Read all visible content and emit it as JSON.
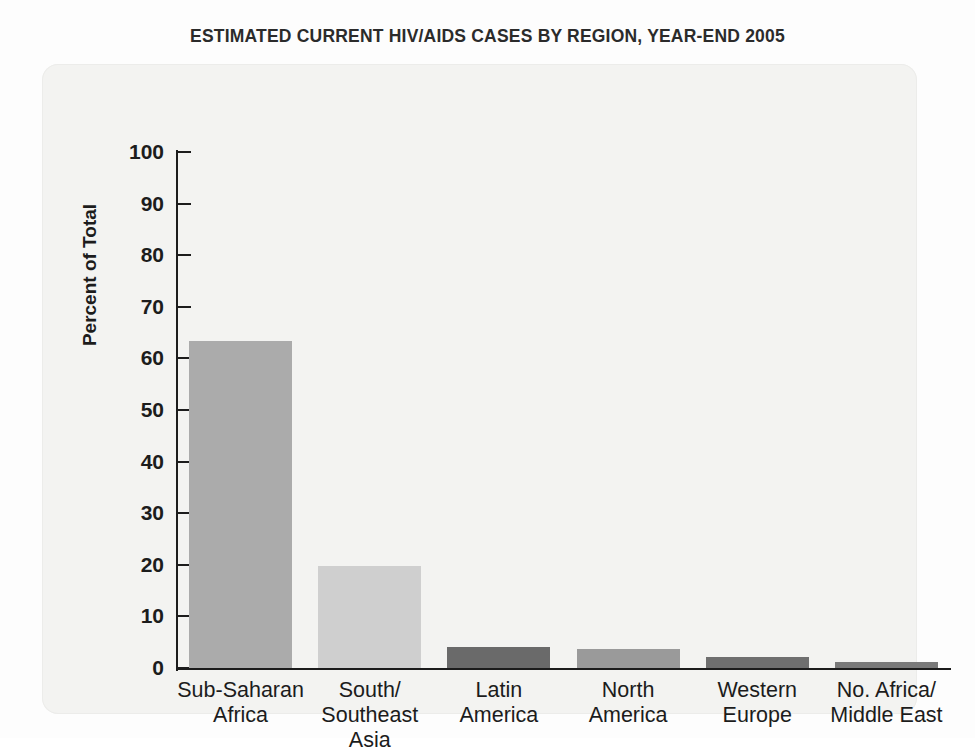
{
  "title": "ESTIMATED CURRENT HIV/AIDS CASES BY REGION, YEAR-END 2005",
  "chart_data": {
    "type": "bar",
    "title": "ESTIMATED CURRENT HIV/AIDS CASES BY REGION, YEAR-END 2005",
    "xlabel": "",
    "ylabel": "Percent of Total",
    "ylim": [
      0,
      100
    ],
    "ytick_step": 10,
    "ytick_labels": [
      "100",
      "90",
      "80",
      "70",
      "60",
      "50",
      "40",
      "30",
      "20",
      "10",
      "0"
    ],
    "ytick_values": [
      100,
      90,
      80,
      70,
      60,
      50,
      40,
      30,
      20,
      10,
      0
    ],
    "grid": false,
    "legend": "none",
    "categories": [
      "Sub-Saharan\nAfrica",
      "South/\nSoutheast\nAsia",
      "Latin\nAmerica",
      "North\nAmerica",
      "Western\nEurope",
      "No. Africa/\nMiddle East"
    ],
    "values": [
      63.4,
      19.7,
      4.1,
      3.7,
      2.2,
      1.2
    ],
    "bar_colors": [
      "#ababab",
      "#cfcfcf",
      "#6a6a6a",
      "#9a9a9a",
      "#6f6f6f",
      "#7a7a7a"
    ]
  },
  "colors": {
    "panel_background": "#f3f3f1",
    "page_background": "#fdfdfd",
    "axis": "#1c1c1c",
    "text": "#1c1c1c",
    "title": "#2b2b2b"
  }
}
